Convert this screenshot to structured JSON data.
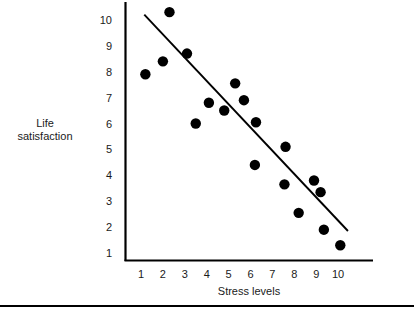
{
  "chart_data": {
    "type": "scatter",
    "title": "",
    "xlabel": "Stress levels",
    "ylabel": "Life satisfaction",
    "ylabel_lines": [
      "Life",
      "satisfaction"
    ],
    "xlim": [
      0.3,
      10.9
    ],
    "ylim": [
      0.55,
      10.55
    ],
    "xticks": [
      1,
      2,
      3,
      4,
      5,
      6,
      7,
      8,
      9,
      10
    ],
    "yticks": [
      1,
      2,
      3,
      4,
      5,
      6,
      7,
      8,
      9,
      10
    ],
    "xtick_labels": [
      "1",
      "2",
      "3",
      "4",
      "5",
      "6",
      "7",
      "8",
      "9",
      "10"
    ],
    "ytick_labels": [
      "1",
      "2",
      "3",
      "4",
      "5",
      "6",
      "7",
      "8",
      "9",
      "10"
    ],
    "grid": false,
    "legend": false,
    "marker_color": "#000000",
    "marker_size": 5.2,
    "line_color": "#000000",
    "axis_color": "#000000",
    "points": [
      {
        "x": 1.2,
        "y": 7.9
      },
      {
        "x": 2.0,
        "y": 8.4
      },
      {
        "x": 2.3,
        "y": 10.3
      },
      {
        "x": 3.1,
        "y": 8.7
      },
      {
        "x": 3.5,
        "y": 6.0
      },
      {
        "x": 4.1,
        "y": 6.8
      },
      {
        "x": 4.8,
        "y": 6.5
      },
      {
        "x": 5.3,
        "y": 7.55
      },
      {
        "x": 5.7,
        "y": 6.9
      },
      {
        "x": 6.25,
        "y": 6.05
      },
      {
        "x": 6.2,
        "y": 4.4
      },
      {
        "x": 7.6,
        "y": 5.1
      },
      {
        "x": 7.55,
        "y": 3.65
      },
      {
        "x": 8.2,
        "y": 2.55
      },
      {
        "x": 8.9,
        "y": 3.8
      },
      {
        "x": 9.2,
        "y": 3.35
      },
      {
        "x": 9.35,
        "y": 1.9
      },
      {
        "x": 10.1,
        "y": 1.3
      }
    ],
    "trendline": {
      "name": "best-fit-line",
      "x0": 1.15,
      "y0": 10.2,
      "x1": 10.45,
      "y1": 1.85
    }
  },
  "footer": {
    "rule": ""
  }
}
